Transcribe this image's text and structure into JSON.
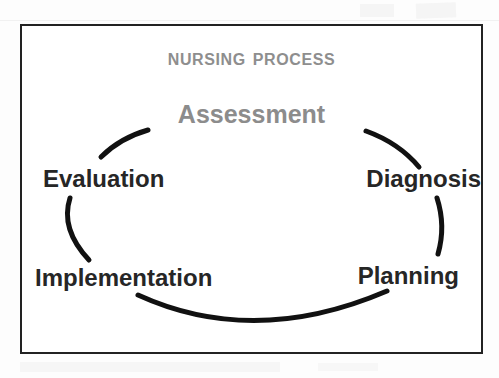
{
  "page": {
    "background_color": "#fdfdfd",
    "frame_border_color": "#222222"
  },
  "diagram": {
    "title": "Nursing Process",
    "title_color": "#8e8e8e",
    "shape": "broken-ellipse-cycle",
    "arc_color": "#111111",
    "nodes": [
      {
        "id": "assessment",
        "label": "Assessment",
        "position": "top",
        "color": "#8c8c8c"
      },
      {
        "id": "diagnosis",
        "label": "Diagnosis",
        "position": "upper-right",
        "color": "#262626"
      },
      {
        "id": "planning",
        "label": "Planning",
        "position": "lower-right",
        "color": "#262626"
      },
      {
        "id": "implementation",
        "label": "Implementation",
        "position": "lower-left",
        "color": "#262626"
      },
      {
        "id": "evaluation",
        "label": "Evaluation",
        "position": "upper-left",
        "color": "#262626"
      }
    ]
  }
}
